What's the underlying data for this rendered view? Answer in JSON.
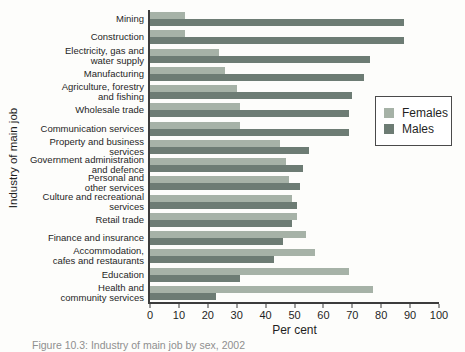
{
  "figure": {
    "caption": "Figure 10.3: Industry of main job by sex, 2002"
  },
  "chart_data": {
    "type": "bar",
    "orientation": "horizontal",
    "title": "",
    "xlabel": "Per cent",
    "ylabel": "Industry of main job",
    "xlim": [
      0,
      100
    ],
    "xticks": [
      0,
      10,
      20,
      30,
      40,
      50,
      60,
      70,
      80,
      90,
      100
    ],
    "grid": false,
    "legend": {
      "position": "right-inside",
      "entries": [
        "Females",
        "Males"
      ]
    },
    "categories": [
      "Mining",
      "Construction",
      "Electricity, gas and\nwater supply",
      "Manufacturing",
      "Agriculture, forestry\nand fishing",
      "Wholesale trade",
      "Communication services",
      "Property and business\nservices",
      "Government administration\nand defence",
      "Personal and\nother services",
      "Culture and recreational\nservices",
      "Retail trade",
      "Finance and insurance",
      "Accommodation,\ncafes and restaurants",
      "Education",
      "Health and\ncommunity services"
    ],
    "series": [
      {
        "name": "Females",
        "color": "#a6b2a7",
        "values": [
          12,
          12,
          24,
          26,
          30,
          31,
          31,
          45,
          47,
          48,
          49,
          51,
          54,
          57,
          69,
          77
        ]
      },
      {
        "name": "Males",
        "color": "#6d7c74",
        "values": [
          88,
          88,
          76,
          74,
          70,
          69,
          69,
          55,
          53,
          52,
          51,
          49,
          46,
          43,
          31,
          23
        ]
      }
    ]
  },
  "colors": {
    "axis": "#3c3c3c",
    "text": "#1f1f1f",
    "caption_text": "#8f8f8f",
    "legend_border": "#4a4a4a",
    "background": "#fdfdfb"
  }
}
